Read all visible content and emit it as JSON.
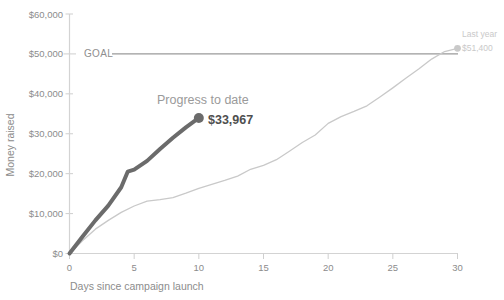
{
  "chart_data": {
    "type": "line",
    "title": "",
    "xlabel": "Days since campaign launch",
    "ylabel": "Money raised",
    "xlim": [
      0,
      30
    ],
    "ylim": [
      0,
      60000
    ],
    "xticks": [
      "0",
      "5",
      "10",
      "15",
      "20",
      "25",
      "30"
    ],
    "xtick_values": [
      0,
      5,
      10,
      15,
      20,
      25,
      30
    ],
    "yticks": [
      "$0",
      "$10,000",
      "$20,000",
      "$30,000",
      "$40,000",
      "$50,000",
      "$60,000"
    ],
    "ytick_values": [
      0,
      10000,
      20000,
      30000,
      40000,
      50000,
      60000
    ],
    "grid": false,
    "legend_position": "none",
    "series": [
      {
        "name": "Progress to date",
        "color": "#6b6b6b",
        "width": 4,
        "end_label": "$33,967",
        "end_value": 33967,
        "end_day": 10,
        "marker": true,
        "x": [
          0,
          1,
          2,
          3,
          4,
          4.5,
          5,
          6,
          7,
          8,
          9,
          10
        ],
        "values": [
          0,
          4200,
          8300,
          12000,
          16600,
          20500,
          21000,
          23200,
          26200,
          29000,
          31600,
          33967
        ]
      },
      {
        "name": "Last year",
        "color": "#c9c9c9",
        "width": 1.2,
        "end_label": "$51,400",
        "end_value": 51400,
        "end_day": 30,
        "marker": true,
        "x": [
          0,
          1,
          2,
          3,
          4,
          5,
          6,
          7,
          8,
          9,
          10,
          11,
          12,
          13,
          14,
          15,
          16,
          17,
          18,
          19,
          20,
          21,
          22,
          23,
          24,
          25,
          26,
          27,
          28,
          29,
          30
        ],
        "values": [
          0,
          3200,
          6100,
          8300,
          10300,
          11900,
          13100,
          13500,
          14000,
          15100,
          16300,
          17300,
          18300,
          19400,
          21100,
          22100,
          23500,
          25600,
          27800,
          29700,
          32600,
          34300,
          35600,
          37000,
          39200,
          41500,
          43900,
          46200,
          48700,
          50600,
          51400
        ]
      }
    ],
    "reference_line": {
      "label": "GOAL",
      "value": 50000,
      "color": "#9a9a9a"
    }
  },
  "annotations": {
    "progress": {
      "title": "Progress to date",
      "value": "$33,967"
    },
    "lastyear": {
      "title": "Last year",
      "value": "$51,400"
    },
    "goal": {
      "label": "GOAL"
    }
  },
  "colors": {
    "progress_line": "#6b6b6b",
    "lastyear_line": "#c9c9c9",
    "axis": "#d0d0d0",
    "text": "#8c8c8c",
    "value_text": "#4f4f4f"
  }
}
